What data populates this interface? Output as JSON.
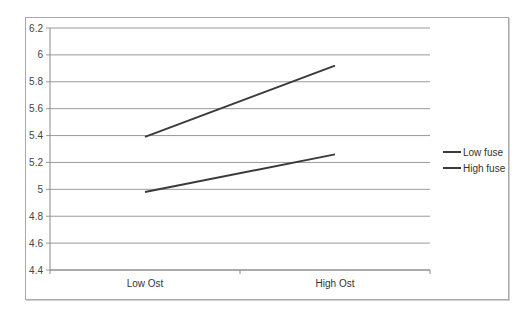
{
  "chart_data": {
    "type": "line",
    "title": "",
    "xlabel": "",
    "ylabel": "",
    "categories": [
      "Low Ost",
      "High Ost"
    ],
    "series": [
      {
        "name": "Low fuse",
        "values": [
          4.98,
          5.26
        ],
        "color": "#3a3a3a"
      },
      {
        "name": "High fuse",
        "values": [
          5.39,
          5.92
        ],
        "color": "#3a3a3a"
      }
    ],
    "ylim": [
      4.4,
      6.2
    ],
    "yticks": [
      6.2,
      6,
      5.8,
      5.6,
      5.4,
      5.2,
      5,
      4.8,
      4.6,
      4.4
    ],
    "ytick_labels": [
      "6.2",
      "6",
      "5.8",
      "5.6",
      "5.4",
      "5.2",
      "5",
      "4.8",
      "4.6",
      "4.4"
    ],
    "grid": true,
    "legend_position": "right"
  },
  "legend": {
    "items": [
      {
        "label": "Low fuse"
      },
      {
        "label": "High fuse"
      }
    ]
  },
  "axis": {
    "x_labels": [
      "Low Ost",
      "High Ost"
    ]
  }
}
